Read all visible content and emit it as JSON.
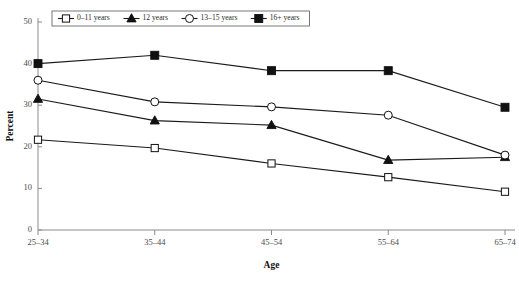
{
  "chart_data": {
    "type": "line",
    "title": "",
    "xlabel": "Age",
    "ylabel": "Percent",
    "categories": [
      "25–34",
      "35–44",
      "45–54",
      "55–64",
      "65–74"
    ],
    "ylim": [
      0,
      50
    ],
    "yticks": [
      0,
      10,
      20,
      30,
      40,
      50
    ],
    "grid": false,
    "legend_position": "top-left",
    "series": [
      {
        "name": "0–11 years",
        "marker": "open-square",
        "values": [
          21.7,
          19.7,
          16.0,
          12.7,
          9.2
        ]
      },
      {
        "name": "12 years",
        "marker": "filled-triangle",
        "values": [
          31.5,
          26.3,
          25.2,
          16.8,
          17.5
        ]
      },
      {
        "name": "13–15 years",
        "marker": "open-circle",
        "values": [
          36.0,
          30.8,
          29.6,
          27.6,
          18.0
        ]
      },
      {
        "name": "16+ years",
        "marker": "filled-square",
        "values": [
          40.0,
          42.0,
          38.3,
          38.3,
          29.5
        ]
      }
    ],
    "colors": {
      "line": "#111111",
      "axis": "#8a8a8a",
      "text": "#2a2a2a",
      "background": "#ffffff"
    }
  }
}
